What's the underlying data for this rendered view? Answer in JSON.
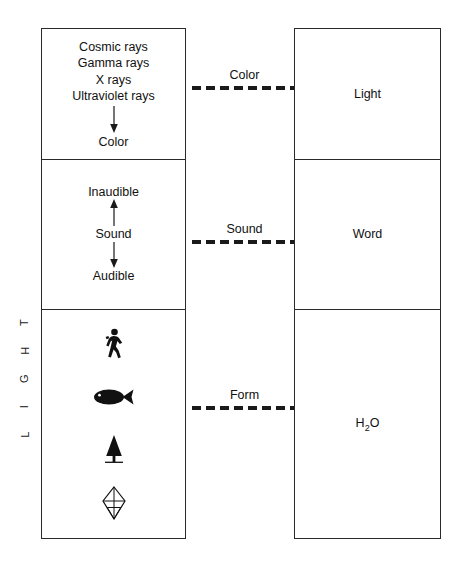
{
  "diagram": {
    "vertical_label": "LIGHT",
    "vertical_label_chars": [
      "L",
      "I",
      "G",
      "H",
      "T"
    ],
    "left_column": {
      "cells": [
        {
          "id": "electromagnetic",
          "lines": [
            "Cosmic rays",
            "Gamma rays",
            "X rays",
            "Ultraviolet rays"
          ],
          "arrow": "down",
          "result": "Color"
        },
        {
          "id": "acoustic",
          "top_term": "Inaudible",
          "arrow_up": "up",
          "middle_term": "Sound",
          "arrow_down": "down",
          "bottom_term": "Audible"
        },
        {
          "id": "matter",
          "icons": [
            {
              "name": "walking-person-icon",
              "label": "Human"
            },
            {
              "name": "fish-icon",
              "label": "Fish"
            },
            {
              "name": "tree-icon",
              "label": "Tree"
            },
            {
              "name": "crystal-icon",
              "label": "Crystal"
            }
          ]
        }
      ]
    },
    "connectors": [
      {
        "id": "color",
        "label": "Color"
      },
      {
        "id": "sound",
        "label": "Sound"
      },
      {
        "id": "form",
        "label": "Form"
      }
    ],
    "right_column": {
      "cells": [
        {
          "id": "light",
          "label": "Light"
        },
        {
          "id": "word",
          "label": "Word"
        },
        {
          "id": "water",
          "label": "H",
          "sub": "2",
          "label_tail": "O"
        }
      ]
    },
    "colors": {
      "stroke": "#2a2a2a",
      "text": "#111111",
      "dash": "#1a1a1a",
      "background": "#ffffff"
    }
  }
}
